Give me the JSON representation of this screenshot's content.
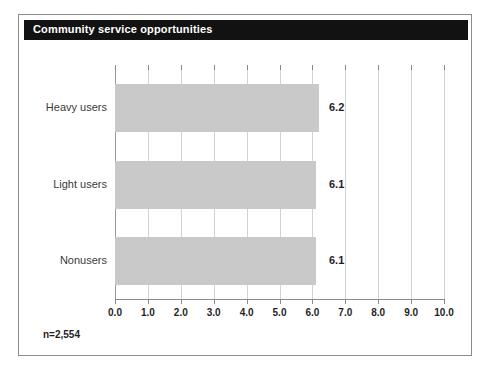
{
  "chart_title": "Community service opportunities",
  "footnote": "n=2,554",
  "colors": {
    "title_bar": "#121212",
    "title_text": "#ffffff",
    "bar_fill": "#c9c9c9",
    "gridline": "#d2d2d2",
    "axis": "#8a8a8a",
    "frame": "#8c8c8c",
    "label_text": "#3b3b3b",
    "value_text": "#1f1f1f"
  },
  "chart_data": {
    "type": "bar",
    "orientation": "horizontal",
    "title": "Community service opportunities",
    "xlabel": "",
    "ylabel": "",
    "categories": [
      "Heavy users",
      "Light users",
      "Nonusers"
    ],
    "values": [
      6.2,
      6.1,
      6.1
    ],
    "value_labels": [
      "6.2",
      "6.1",
      "6.1"
    ],
    "xlim": [
      0,
      10
    ],
    "xticks": [
      0,
      1,
      2,
      3,
      4,
      5,
      6,
      7,
      8,
      9,
      10
    ],
    "xtick_labels": [
      "0.0",
      "1.0",
      "2.0",
      "3.0",
      "4.0",
      "5.0",
      "6.0",
      "7.0",
      "8.0",
      "9.0",
      "10.0"
    ],
    "grid": true,
    "grid_axis": "x",
    "legend": false,
    "annotations": [
      "n=2,554"
    ]
  }
}
